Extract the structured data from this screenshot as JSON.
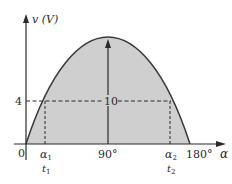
{
  "diagram": {
    "y_axis_label": "v (V)",
    "x_axis_label": "α",
    "origin_label": "0",
    "level_label": "4",
    "peak_label": "10",
    "x_ticks": {
      "alpha1": "α",
      "alpha1_sub": "1",
      "t1": "t",
      "t1_sub": "1",
      "deg90": "90°",
      "alpha2": "α",
      "alpha2_sub": "2",
      "t2": "t",
      "t2_sub": "2",
      "deg180": "180°"
    },
    "colors": {
      "fill": "#cfcfcf",
      "curve": "#3a3a3a",
      "axis": "#2a2a2a"
    }
  }
}
